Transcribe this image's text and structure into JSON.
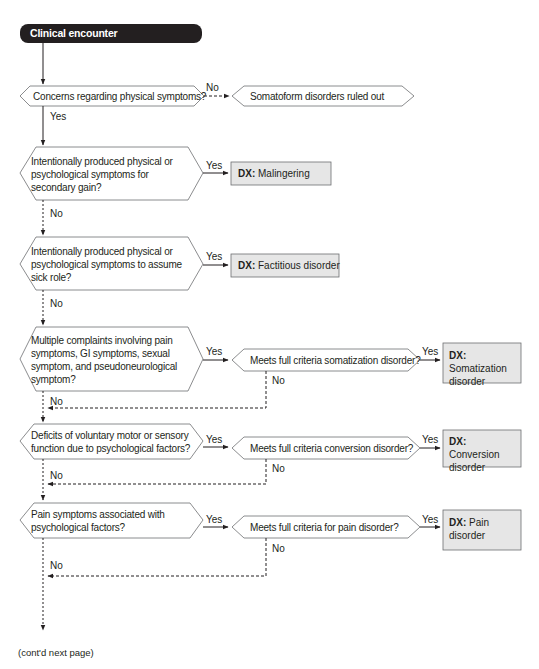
{
  "diagram": {
    "start": {
      "label": "Clinical encounter"
    },
    "questions": [
      {
        "id": "q1",
        "text": "Concerns regarding physical symptoms?",
        "no_label": "No",
        "no_target": "Somatoform disorders ruled out",
        "yes_label": "Yes"
      },
      {
        "id": "q2",
        "text": "Intentionally produced physical or psychological symptoms for secondary gain?",
        "yes_label": "Yes",
        "no_label": "No",
        "dx_prefix": "DX:",
        "dx": "Malingering"
      },
      {
        "id": "q3",
        "text": "Intentionally produced physical or psychological symptoms to assume sick role?",
        "yes_label": "Yes",
        "no_label": "No",
        "dx_prefix": "DX:",
        "dx": "Factitious disorder"
      },
      {
        "id": "q4",
        "text": "Multiple complaints involving pain symptoms, GI symptoms, sexual symptom, and pseudoneurological symptom?",
        "yes_label": "Yes",
        "no_label": "No",
        "sub_question": "Meets full criteria somatization disorder?",
        "sub_yes_label": "Yes",
        "sub_no_label": "No",
        "dx_prefix": "DX:",
        "dx": "Somatization disorder"
      },
      {
        "id": "q5",
        "text": "Deficits of voluntary motor or sensory function due to psychological factors?",
        "yes_label": "Yes",
        "no_label": "No",
        "sub_question": "Meets full criteria conversion disorder?",
        "sub_yes_label": "Yes",
        "sub_no_label": "No",
        "dx_prefix": "DX:",
        "dx": "Conversion disorder"
      },
      {
        "id": "q6",
        "text": "Pain symptoms associated with psychological factors?",
        "yes_label": "Yes",
        "no_label": "No",
        "sub_question": "Meets full criteria for pain disorder?",
        "sub_yes_label": "Yes",
        "sub_no_label": "No",
        "dx_prefix": "DX:",
        "dx": "Pain disorder"
      }
    ],
    "footer": "(cont'd next page)",
    "colors": {
      "start_fill": "#231f20",
      "dx_fill": "#e6e6e6",
      "line": "#231f20",
      "hex_stroke": "#6d6e71"
    }
  }
}
